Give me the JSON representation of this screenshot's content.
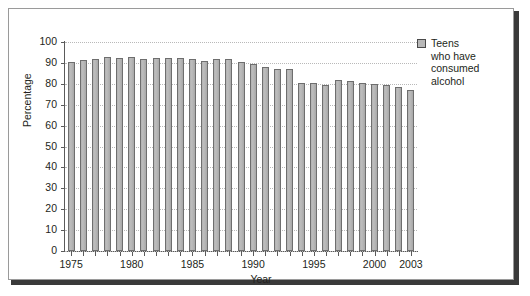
{
  "chart_data": {
    "type": "bar",
    "title": "",
    "xlabel": "Year",
    "ylabel": "Percentage",
    "ylim": [
      0,
      100
    ],
    "ytick_step": 10,
    "yticks": [
      0,
      10,
      20,
      30,
      40,
      50,
      60,
      70,
      80,
      90,
      100
    ],
    "grid": "horizontal-dotted",
    "legend_position": "right",
    "legend": [
      "Teens who have consumed alcohol"
    ],
    "xtick_labels": [
      "1975",
      "1980",
      "1985",
      "1990",
      "1995",
      "2000",
      "2003"
    ],
    "categories": [
      "1975",
      "1976",
      "1977",
      "1978",
      "1979",
      "1980",
      "1981",
      "1982",
      "1983",
      "1984",
      "1985",
      "1986",
      "1987",
      "1988",
      "1989",
      "1990",
      "1991",
      "1992",
      "1993",
      "1994",
      "1995",
      "1996",
      "1997",
      "1998",
      "1999",
      "2000",
      "2001",
      "2002",
      "2003"
    ],
    "values": [
      90.5,
      91.5,
      92.0,
      93.0,
      92.5,
      93.0,
      92.0,
      92.5,
      92.5,
      92.5,
      92.0,
      91.0,
      92.0,
      92.0,
      90.5,
      89.5,
      88.0,
      87.0,
      87.0,
      80.5,
      80.5,
      79.5,
      82.0,
      81.5,
      80.5,
      80.0,
      79.5,
      78.5,
      77.0
    ],
    "series": [
      {
        "name": "Teens who have consumed alcohol",
        "values": [
          90.5,
          91.5,
          92.0,
          93.0,
          92.5,
          93.0,
          92.0,
          92.5,
          92.5,
          92.5,
          92.0,
          91.0,
          92.0,
          92.0,
          90.5,
          89.5,
          88.0,
          87.0,
          87.0,
          80.5,
          80.5,
          79.5,
          82.0,
          81.5,
          80.5,
          80.0,
          79.5,
          78.5,
          77.0
        ],
        "color": "#b5b5b5"
      }
    ]
  },
  "legend": {
    "entries": [
      {
        "label": "Teens\nwho have\nconsumed\nalcohol",
        "swatch_color": "#b8b8b8"
      }
    ]
  },
  "colors": {
    "bar_fill": "#b5b5b5",
    "bar_stroke": "#6e6e6e",
    "axis": "#5a5a5a",
    "grid": "#b9b9b9",
    "text": "#231f20",
    "frame": "#9a9a9a",
    "shadow": "#3a3a3a"
  }
}
